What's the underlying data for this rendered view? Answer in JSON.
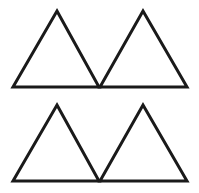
{
  "figure": {
    "canvas": {
      "width": 199,
      "height": 193,
      "background_color": "#ffffff"
    },
    "style": {
      "stroke_color": "#1a1a1a",
      "stroke_width": 3,
      "fill": "none"
    },
    "shape_count": 4,
    "shape_kind": "triangle",
    "layout": {
      "rows": 2,
      "columns": 2
    },
    "shapes": [
      {
        "name": "triangle-top-left",
        "row": 1,
        "column": 1,
        "apex": {
          "x": 57,
          "y": 11
        },
        "base_left": {
          "x": 13,
          "y": 87
        },
        "base_right": {
          "x": 99,
          "y": 87
        },
        "points": "57,11 99,87 13,87",
        "base_width": 86,
        "height": 76,
        "orientation": "apex-up"
      },
      {
        "name": "triangle-top-right",
        "row": 1,
        "column": 2,
        "apex": {
          "x": 143,
          "y": 11
        },
        "base_left": {
          "x": 100,
          "y": 87
        },
        "base_right": {
          "x": 187,
          "y": 87
        },
        "points": "143,11 187,87 100,87",
        "base_width": 87,
        "height": 76,
        "orientation": "apex-up"
      },
      {
        "name": "triangle-bottom-left",
        "row": 2,
        "column": 1,
        "apex": {
          "x": 57,
          "y": 105
        },
        "base_left": {
          "x": 13,
          "y": 181
        },
        "base_right": {
          "x": 99,
          "y": 181
        },
        "points": "57,105 99,181 13,181",
        "base_width": 86,
        "height": 76,
        "orientation": "apex-up"
      },
      {
        "name": "triangle-bottom-right",
        "row": 2,
        "column": 2,
        "apex": {
          "x": 143,
          "y": 105
        },
        "base_left": {
          "x": 100,
          "y": 181
        },
        "base_right": {
          "x": 187,
          "y": 181
        },
        "points": "143,105 187,181 100,181",
        "base_width": 87,
        "height": 76,
        "orientation": "apex-up"
      }
    ]
  }
}
